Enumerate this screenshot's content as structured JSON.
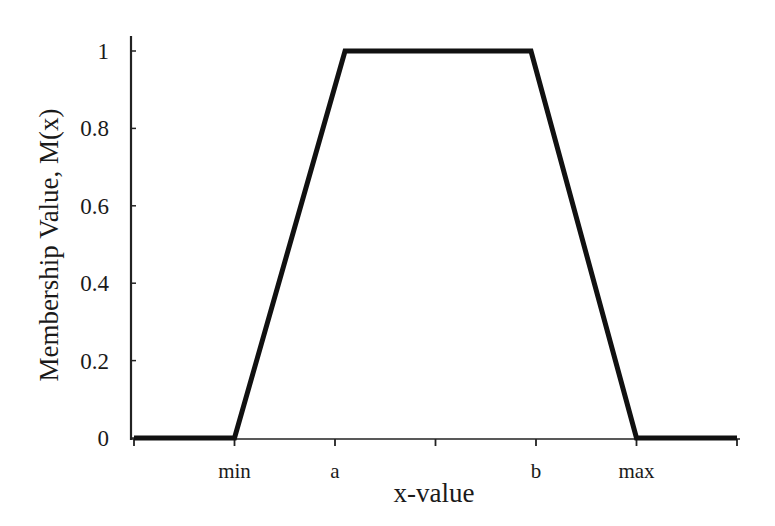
{
  "chart_data": {
    "type": "line",
    "title": "",
    "xlabel": "x-value",
    "ylabel": "Membership Value, M(x)",
    "x_tick_labels": [
      "",
      "min",
      "a",
      "",
      "b",
      "max",
      ""
    ],
    "y_tick_labels": [
      "0",
      "0.2",
      "0.4",
      "0.6",
      "0.8",
      "1"
    ],
    "y_ticks": [
      0,
      0.2,
      0.4,
      0.6,
      0.8,
      1
    ],
    "ylim": [
      0,
      1.04
    ],
    "x_positions": [
      0,
      1,
      2,
      3,
      4,
      5,
      6
    ],
    "xlim": [
      0,
      6
    ],
    "grid": false,
    "legend": null,
    "series": [
      {
        "name": "Trapezoidal membership function",
        "x": [
          0,
          1,
          2.1,
          3.95,
          5,
          6
        ],
        "y": [
          0,
          0,
          1,
          1,
          0,
          0
        ],
        "points_labeled": [
          "start",
          "min",
          "a",
          "b",
          "max",
          "end"
        ],
        "color": "#111111"
      }
    ]
  }
}
